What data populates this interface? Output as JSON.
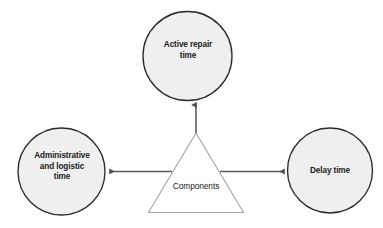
{
  "diagram": {
    "type": "triangle-hub-and-spoke",
    "background_color": "#ffffff",
    "center": {
      "shape": "triangle",
      "label": "Components",
      "fill_color": "#ffffff",
      "stroke_color": "#a6a6a6"
    },
    "nodes": [
      {
        "id": "active-repair-time",
        "label": "Active repair\ntime",
        "shape": "circle",
        "fill_color": "#efefef",
        "stroke_color": "#2b2b2b",
        "position": "top"
      },
      {
        "id": "administrative-logistic-time",
        "label": "Administrative\nand logistic\ntime",
        "shape": "circle",
        "fill_color": "#efefef",
        "stroke_color": "#2b2b2b",
        "position": "left"
      },
      {
        "id": "delay-time",
        "label": "Delay time",
        "shape": "circle",
        "fill_color": "#efefef",
        "stroke_color": "#2b2b2b",
        "position": "right"
      }
    ],
    "connectors": [
      {
        "id": "connector-to-active-repair-time",
        "from": "components",
        "to": "active-repair-time",
        "direction": "up",
        "arrowhead": "end",
        "color": "#5a5a5a"
      },
      {
        "id": "connector-to-administrative-logistic-time",
        "from": "components",
        "to": "administrative-logistic-time",
        "direction": "left",
        "arrowhead": "end",
        "color": "#5a5a5a"
      },
      {
        "id": "connector-to-delay-time",
        "from": "components",
        "to": "delay-time",
        "direction": "right",
        "arrowhead": "end",
        "color": "#5a5a5a"
      }
    ]
  }
}
